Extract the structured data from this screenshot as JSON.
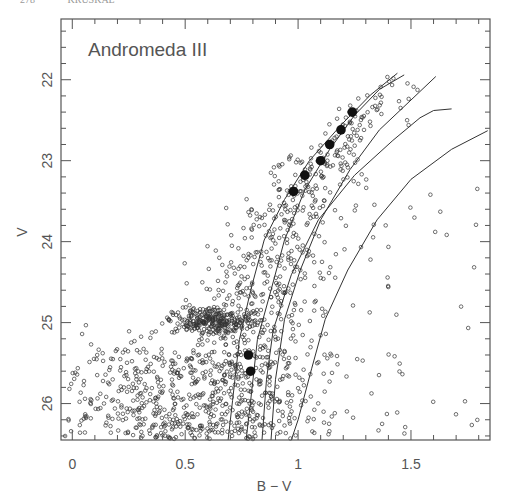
{
  "header": {
    "page_number": "278",
    "running_title": "KRUSKAL"
  },
  "chart_data": {
    "type": "scatter",
    "title": "",
    "annotation": "Andromeda III",
    "xlabel": "B − V",
    "ylabel": "V",
    "xlim": [
      -0.05,
      1.85
    ],
    "ylim": [
      26.45,
      21.25
    ],
    "y_inverted": true,
    "grid": false,
    "legend": null,
    "x_ticks": [
      0,
      0.5,
      1,
      1.5
    ],
    "x_tick_labels": [
      "0",
      "0.5",
      "1",
      "1.5"
    ],
    "y_ticks": [
      22,
      23,
      24,
      25,
      26
    ],
    "y_tick_labels": [
      "22",
      "23",
      "24",
      "25",
      "26"
    ],
    "series": [
      {
        "name": "stars",
        "marker": "open-circle",
        "note": "~1500 stars; red giant branch, red clump near B-V 0.6, V 25",
        "generator": {
          "seed": 7,
          "counts": {
            "rgb": 750,
            "clump": 280,
            "faint": 380,
            "blue": 70,
            "field": 70
          }
        }
      },
      {
        "name": "highlighted_stars",
        "marker": "filled-circle",
        "points": [
          [
            1.24,
            22.4
          ],
          [
            1.19,
            22.62
          ],
          [
            1.14,
            22.8
          ],
          [
            1.1,
            23.0
          ],
          [
            1.03,
            23.18
          ],
          [
            0.98,
            23.38
          ],
          [
            0.78,
            25.4
          ],
          [
            0.79,
            25.6
          ]
        ]
      },
      {
        "name": "isochrone_1",
        "marker": "line",
        "points": [
          [
            1.44,
            21.92
          ],
          [
            1.32,
            22.19
          ],
          [
            1.19,
            22.56
          ],
          [
            1.05,
            23.0
          ],
          [
            0.94,
            23.48
          ],
          [
            0.85,
            23.98
          ],
          [
            0.79,
            24.6
          ],
          [
            0.74,
            25.21
          ],
          [
            0.71,
            25.96
          ],
          [
            0.69,
            26.45
          ]
        ]
      },
      {
        "name": "isochrone_2",
        "marker": "line",
        "points": [
          [
            1.47,
            21.94
          ],
          [
            1.36,
            22.12
          ],
          [
            1.25,
            22.44
          ],
          [
            1.14,
            22.86
          ],
          [
            1.03,
            23.36
          ],
          [
            0.94,
            23.98
          ],
          [
            0.88,
            24.6
          ],
          [
            0.82,
            25.21
          ],
          [
            0.79,
            25.96
          ],
          [
            0.77,
            26.45
          ]
        ]
      },
      {
        "name": "isochrone_3",
        "marker": "line",
        "points": [
          [
            1.61,
            21.96
          ],
          [
            1.5,
            22.25
          ],
          [
            1.36,
            22.62
          ],
          [
            1.23,
            23.11
          ],
          [
            1.1,
            23.73
          ],
          [
            1.01,
            24.35
          ],
          [
            0.94,
            24.96
          ],
          [
            0.9,
            25.7
          ],
          [
            0.88,
            26.45
          ]
        ]
      },
      {
        "name": "isochrone_4",
        "marker": "line",
        "points": [
          [
            1.68,
            22.36
          ],
          [
            1.6,
            22.38
          ],
          [
            1.54,
            22.47
          ],
          [
            1.42,
            22.75
          ],
          [
            1.25,
            23.18
          ],
          [
            1.09,
            23.73
          ],
          [
            0.97,
            24.41
          ],
          [
            0.89,
            25.09
          ],
          [
            0.86,
            25.7
          ],
          [
            0.84,
            26.45
          ]
        ]
      },
      {
        "name": "isochrone_5",
        "marker": "line",
        "points": [
          [
            1.84,
            22.63
          ],
          [
            1.68,
            22.86
          ],
          [
            1.5,
            23.23
          ],
          [
            1.35,
            23.73
          ],
          [
            1.22,
            24.35
          ],
          [
            1.12,
            24.96
          ],
          [
            1.06,
            25.57
          ],
          [
            1.0,
            26.2
          ],
          [
            0.97,
            26.45
          ]
        ]
      }
    ]
  }
}
